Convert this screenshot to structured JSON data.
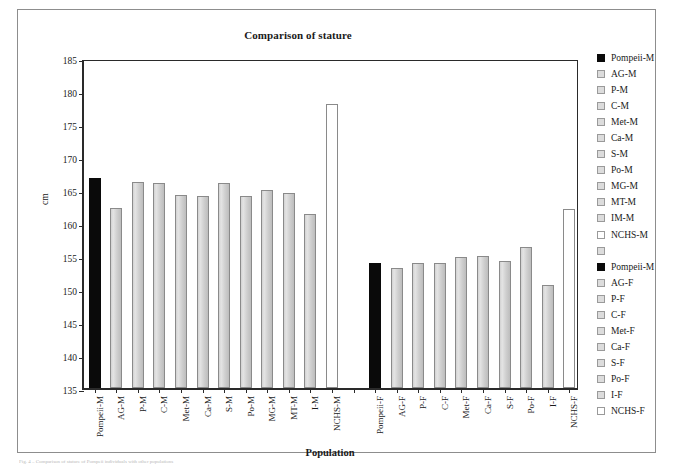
{
  "figure": {
    "caption": "Fig. 4 – Comparison of stature of Pompeii individuals with other populations"
  },
  "chart_data": {
    "type": "bar",
    "title": "Comparison of stature",
    "xlabel": "Population",
    "ylabel": "cm",
    "ylim": [
      135,
      185
    ],
    "yticks": [
      135,
      140,
      145,
      150,
      155,
      160,
      165,
      170,
      175,
      180,
      185
    ],
    "grid": false,
    "legend_position": "right",
    "categories": [
      "Pompeii-M",
      "AG-M",
      "P-M",
      "C-M",
      "Met-M",
      "Ca-M",
      "S-M",
      "Po-M",
      "MG-M",
      "MT-M",
      "I-M",
      "NCHS-M",
      "",
      "Pompeii-F",
      "AG-F",
      "P-F",
      "C-F",
      "Met-F",
      "Ca-F",
      "S-F",
      "Po-F",
      "I-F",
      "NCHS-F"
    ],
    "values": [
      166.8,
      162.3,
      166.2,
      166.0,
      164.2,
      164.1,
      166.1,
      164.1,
      165.0,
      164.6,
      161.4,
      178.1,
      null,
      154.0,
      153.2,
      153.9,
      153.9,
      154.9,
      155.0,
      154.2,
      156.4,
      150.6,
      162.1
    ],
    "bar_styles": [
      "solid",
      "grey",
      "grey",
      "grey",
      "grey",
      "grey",
      "grey",
      "grey",
      "grey",
      "grey",
      "grey",
      "white",
      "none",
      "solid",
      "grey",
      "grey",
      "grey",
      "grey",
      "grey",
      "grey",
      "grey",
      "grey",
      "white"
    ],
    "colors": {
      "solid": "#0a0a0a",
      "grey": "#d8d8d8",
      "white": "#ffffff",
      "outline": "#8a8a8a",
      "axis": "#2a2a2a"
    }
  },
  "legend": {
    "items": [
      {
        "label": "Pompeii-M",
        "style": "solid"
      },
      {
        "label": "AG-M",
        "style": "grey"
      },
      {
        "label": "P-M",
        "style": "grey"
      },
      {
        "label": "C-M",
        "style": "grey"
      },
      {
        "label": "Met-M",
        "style": "grey"
      },
      {
        "label": "Ca-M",
        "style": "grey"
      },
      {
        "label": "S-M",
        "style": "grey"
      },
      {
        "label": "Po-M",
        "style": "grey"
      },
      {
        "label": "MG-M",
        "style": "grey"
      },
      {
        "label": "MT-M",
        "style": "grey"
      },
      {
        "label": "IM-M",
        "style": "grey"
      },
      {
        "label": "NCHS-M",
        "style": "white"
      },
      {
        "label": "",
        "style": "grey"
      },
      {
        "label": "Pompeii-M",
        "style": "solid"
      },
      {
        "label": "AG-F",
        "style": "grey"
      },
      {
        "label": "P-F",
        "style": "grey"
      },
      {
        "label": "C-F",
        "style": "grey"
      },
      {
        "label": "Met-F",
        "style": "grey"
      },
      {
        "label": "Ca-F",
        "style": "grey"
      },
      {
        "label": "S-F",
        "style": "grey"
      },
      {
        "label": "Po-F",
        "style": "grey"
      },
      {
        "label": "I-F",
        "style": "grey"
      },
      {
        "label": "NCHS-F",
        "style": "white"
      }
    ]
  }
}
